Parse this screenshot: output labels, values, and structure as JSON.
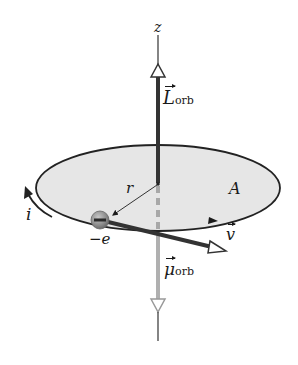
{
  "diagram": {
    "labels": {
      "z_axis": "z",
      "L_orb_symbol": "L",
      "L_orb_sub": "orb",
      "radius": "r",
      "area": "A",
      "current": "i",
      "charge": "−e",
      "velocity": "v",
      "mu_orb_symbol": "μ",
      "mu_orb_sub": "orb"
    },
    "colors": {
      "orbit_fill": "#e6e6e6",
      "orbit_stroke": "#222222",
      "L_vector": "#333333",
      "mu_vector": "#b0b0b0",
      "electron": "#8a8a8a",
      "text": "#1a1a1a"
    }
  }
}
